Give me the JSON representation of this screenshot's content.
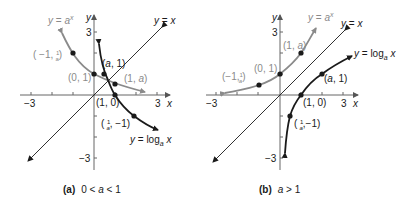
{
  "panels": [
    {
      "id": "a",
      "caption_label": "(a)",
      "caption_condition": "0 < a < 1",
      "a_value": 0.5,
      "axis": {
        "x_label": "x",
        "y_label": "y",
        "x_min_tick": "−3",
        "x_max_tick": "3",
        "y_max_tick": "3",
        "y_min_tick": "−3"
      },
      "curves": {
        "exp_label": "y = a",
        "exp_sup": "x",
        "identity_label": "y = x",
        "log_label": "y = log",
        "log_sub": "a",
        "log_var": " x"
      },
      "points": {
        "p1": "(−1, ",
        "p1_frac": "1/a",
        "p2": "(0, 1)",
        "p3": "(a, 1)",
        "p4": "(1, a)",
        "p5": "(1, 0)",
        "p6_frac": "1/a",
        "p6": ", −1)"
      }
    },
    {
      "id": "b",
      "caption_label": "(b)",
      "caption_condition": "a > 1",
      "a_value": 2,
      "axis": {
        "x_label": "x",
        "y_label": "y",
        "x_min_tick": "−3",
        "x_max_tick": "3",
        "y_max_tick": "3",
        "y_min_tick": "−3"
      },
      "curves": {
        "exp_label": "y = a",
        "exp_sup": "x",
        "identity_label": "y = x",
        "log_label": "y = log",
        "log_sub": "a",
        "log_var": " x"
      },
      "points": {
        "p1": "(−1,",
        "p1_frac": "1/a",
        "p2": "(0, 1)",
        "p3": "(1, a)",
        "p4": "(a, 1)",
        "p5": "(1, 0)",
        "p6_frac": "1/a",
        "p6": ",−1)"
      }
    }
  ],
  "colors": {
    "exp_curve": "#8a8a8a",
    "log_curve": "#1a1a1a",
    "identity": "#1a1a1a",
    "axes": "#555555"
  }
}
